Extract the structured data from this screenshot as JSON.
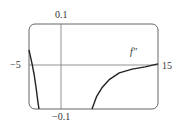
{
  "chart_data": {
    "type": "line",
    "title": "",
    "xlabel": "",
    "ylabel": "",
    "xlim": [
      -5,
      15
    ],
    "ylim": [
      -0.1,
      0.1
    ],
    "grid": false,
    "frame": "rounded-rectangle",
    "axes_through_origin": true,
    "tick_labels": {
      "x_min": "−5",
      "x_max": "15",
      "y_max": "0.1",
      "y_min": "−0.1"
    },
    "annotations": [
      {
        "text": "f″",
        "x": 11.2,
        "y": 0.028
      }
    ],
    "series": [
      {
        "name": "f″",
        "branches": [
          {
            "x": [
              -5.0,
              -4.8,
              -4.5,
              -4.2,
              -3.9,
              -3.6,
              -3.45
            ],
            "y": [
              0.039,
              0.025,
              0.005,
              -0.02,
              -0.05,
              -0.085,
              -0.1
            ]
          },
          {
            "x": [
              4.77,
              5.5,
              6.3,
              7.5,
              9.0,
              11.0,
              13.0,
              15.0
            ],
            "y": [
              -0.1,
              -0.07,
              -0.05,
              -0.03,
              -0.015,
              -0.006,
              -0.001,
              0.006
            ]
          }
        ]
      }
    ]
  },
  "labels": {
    "x_min": "−5",
    "x_max": "15",
    "y_max": "0.1",
    "y_min": "−0.1",
    "curve": "f″"
  }
}
